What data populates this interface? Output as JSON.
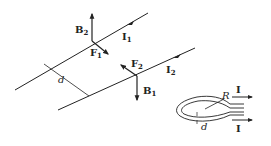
{
  "diagram": {
    "type": "physics-two-parallel-wires-and-loop",
    "wire1": {
      "current_label": "I",
      "current_sub": "1",
      "field_label": "B",
      "field_sub": "2",
      "force_label": "F",
      "force_sub": "1"
    },
    "wire2": {
      "current_label": "I",
      "current_sub": "2",
      "field_label": "B",
      "field_sub": "1",
      "force_label": "F",
      "force_sub": "2"
    },
    "separation_label": "d",
    "loop": {
      "radius_label": "R",
      "gap_label": "d",
      "current_top": "I",
      "current_bottom": "I"
    },
    "colors": {
      "line": "#222222",
      "background": "#ffffff"
    }
  }
}
